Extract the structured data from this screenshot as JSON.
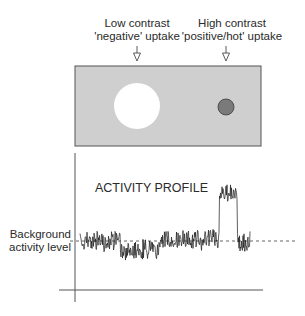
{
  "labels": {
    "low_contrast_line1": "Low contrast",
    "low_contrast_line2": "'negative' uptake",
    "high_contrast_line1": "High contrast",
    "high_contrast_line2": "'positive/hot' uptake",
    "profile_title": "ACTIVITY PROFILE",
    "background_line1": "Background",
    "background_line2": "activity level"
  },
  "colors": {
    "panel_fill": "#cfcfcf",
    "panel_stroke": "#555555",
    "cold_spot_fill": "#ffffff",
    "hot_spot_fill": "#7a7a7a",
    "hot_spot_stroke": "#3a3a3a",
    "signal": "#1a1a1a",
    "axis": "#555555",
    "dashed": "#555555"
  },
  "icons": {
    "low_contrast_arrow": "down-arrow-icon",
    "high_contrast_arrow": "down-arrow-icon"
  },
  "chart_data": {
    "type": "line",
    "title": "ACTIVITY PROFILE",
    "xlabel": "",
    "ylabel": "",
    "annotations": [
      "Background activity level (dashed line)"
    ],
    "grid": false,
    "segments": [
      {
        "name": "background",
        "x_start": 0.0,
        "x_end": 0.25,
        "level": 1.0
      },
      {
        "name": "low contrast 'negative' uptake",
        "x_start": 0.25,
        "x_end": 0.49,
        "level": 0.75
      },
      {
        "name": "background",
        "x_start": 0.49,
        "x_end": 0.86,
        "level": 1.05
      },
      {
        "name": "high contrast 'positive/hot' uptake",
        "x_start": 0.86,
        "x_end": 0.97,
        "level": 2.4
      },
      {
        "name": "background",
        "x_start": 0.97,
        "x_end": 1.05,
        "level": 0.95
      }
    ],
    "background_level": 1.0
  }
}
